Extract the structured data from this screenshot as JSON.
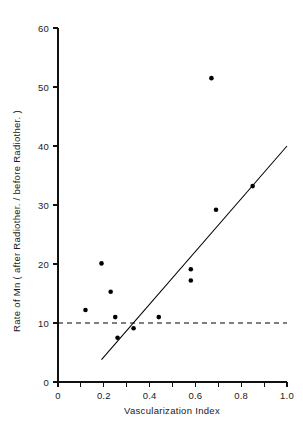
{
  "chart_data": {
    "type": "scatter",
    "title": "",
    "xlabel": "Vascularization Index",
    "ylabel": "Rate of Mn ( after Radiother. / before Radiother. )",
    "xlim": [
      0,
      1.0
    ],
    "ylim": [
      0,
      60
    ],
    "grid": false,
    "legend": null,
    "x_ticks_major": [
      "0",
      "0.2",
      "0.4",
      "0.6",
      "0.8",
      "1.0"
    ],
    "x_tick_values": [
      0,
      0.2,
      0.4,
      0.6,
      0.8,
      1.0
    ],
    "x_minor_tick_values": [
      0.1,
      0.3,
      0.5,
      0.7,
      0.9
    ],
    "y_ticks_major": [
      "0",
      "10",
      "20",
      "30",
      "40",
      "50",
      "60"
    ],
    "y_tick_values": [
      0,
      10,
      20,
      30,
      40,
      50,
      60
    ],
    "points": [
      {
        "x": 0.12,
        "y": 12.2
      },
      {
        "x": 0.19,
        "y": 20.1
      },
      {
        "x": 0.23,
        "y": 15.3
      },
      {
        "x": 0.25,
        "y": 11.0
      },
      {
        "x": 0.26,
        "y": 7.5
      },
      {
        "x": 0.33,
        "y": 9.1
      },
      {
        "x": 0.44,
        "y": 11.0
      },
      {
        "x": 0.58,
        "y": 19.1
      },
      {
        "x": 0.58,
        "y": 17.2
      },
      {
        "x": 0.67,
        "y": 51.5
      },
      {
        "x": 0.69,
        "y": 29.2
      },
      {
        "x": 0.85,
        "y": 33.2
      }
    ],
    "annotations": [
      {
        "name": "regression-line",
        "type": "line",
        "x0": 0.19,
        "y0": 3.8,
        "x1": 1.0,
        "y1": 40.0
      },
      {
        "name": "reference-line",
        "type": "hline",
        "y": 10,
        "style": "dashed",
        "x0": 0.0,
        "x1": 1.0
      }
    ]
  }
}
